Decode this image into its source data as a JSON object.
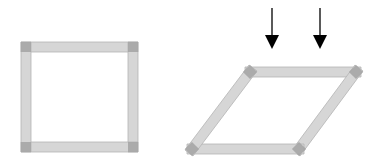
{
  "diagram": {
    "colors": {
      "background": "#ffffff",
      "bar_fill": "#d6d6d6",
      "bar_stroke": "#b4b4b4",
      "joint_fill": "#a3a3a3",
      "arrow": "#000000"
    },
    "square_frame": {
      "label": "undeformed square frame",
      "corners": [
        [
          26,
          47
        ],
        [
          133,
          47
        ],
        [
          133,
          147
        ],
        [
          26,
          147
        ]
      ],
      "bar_thickness": 10
    },
    "sheared_frame": {
      "label": "sheared parallelogram frame",
      "corners": [
        [
          250,
          72
        ],
        [
          356,
          72
        ],
        [
          299,
          149
        ],
        [
          192,
          149
        ]
      ],
      "bar_thickness": 10
    },
    "arrows": [
      {
        "label": "downward force 1",
        "x": 272,
        "y_start": 8,
        "y_end": 49
      },
      {
        "label": "downward force 2",
        "x": 320,
        "y_start": 8,
        "y_end": 49
      }
    ]
  }
}
